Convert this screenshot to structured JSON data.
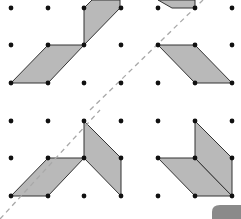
{
  "diagram": {
    "colors": {
      "background": "#ffffff",
      "dot": "#111111",
      "shape_fill": "#b9b9b9",
      "shape_stroke": "#333333",
      "mirror_line": "#a8a8a8",
      "corner_tab": "#8a8a8a"
    },
    "grid": {
      "columns_x": [
        11,
        48,
        84,
        121,
        158,
        195,
        232
      ],
      "rows_y": [
        8,
        45,
        83,
        121,
        158,
        196
      ]
    },
    "shapes": [
      {
        "name": "top-left-lower-parallelogram",
        "points": "11,83 48,83 84,45 48,45"
      },
      {
        "name": "top-left-upper-parallelogram",
        "points": "84,45 84,8 92,0 120,0 120,8"
      },
      {
        "name": "top-right-upper-parallelogram",
        "points": "158,0 195,0 195,8 172,8"
      },
      {
        "name": "top-right-lower-parallelogram",
        "points": "158,45 195,45 232,83 195,83"
      },
      {
        "name": "bottom-left-horizontal-parallelogram",
        "points": "11,196 48,196 84,158 48,158"
      },
      {
        "name": "bottom-left-vertical-parallelogram",
        "points": "84,121 84,158 121,196 121,158"
      },
      {
        "name": "bottom-right-horizontal-parallelogram",
        "points": "158,158 195,158 232,196 195,196"
      },
      {
        "name": "bottom-right-vertical-parallelogram",
        "points": "195,121 195,158 232,196 232,158"
      }
    ],
    "mirror_lines": [
      {
        "name": "top-mirror-line",
        "x1": 90,
        "y1": 110,
        "x2": 203,
        "y2": 0
      },
      {
        "name": "bottom-mirror-line",
        "x1": 0,
        "y1": 219,
        "x2": 100,
        "y2": 110
      }
    ]
  }
}
